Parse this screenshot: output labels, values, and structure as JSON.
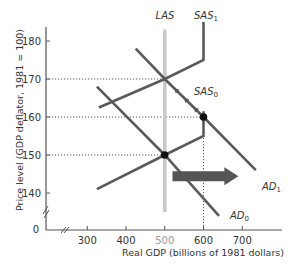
{
  "chart_data": {
    "type": "line",
    "title": "",
    "xlabel": "Real GDP (billions of 1981 dollars)",
    "ylabel": "Price level (GDP deflator, 1981 = 100)",
    "xlim": [
      250,
      800
    ],
    "ylim": [
      135,
      185
    ],
    "x_axis_break": true,
    "y_axis_break": true,
    "origin_label": "0",
    "xticks": [
      300,
      400,
      500,
      600,
      700
    ],
    "xtick_labels": [
      "300",
      "400",
      "500",
      "600",
      "700"
    ],
    "yticks": [
      140,
      150,
      160,
      170,
      180
    ],
    "ytick_labels": [
      "140",
      "150",
      "160",
      "170",
      "180"
    ],
    "grid": false,
    "series": [
      {
        "name": "LAS",
        "label_main": "LAS",
        "label_sub": "",
        "color": "#c8c8c8",
        "points": [
          [
            500,
            135
          ],
          [
            500,
            183
          ]
        ]
      },
      {
        "name": "SAS1",
        "label_main": "SAS",
        "label_sub": "1",
        "color": "#5a5a5a",
        "points": [
          [
            330,
            162.5
          ],
          [
            500,
            170
          ],
          [
            600,
            175
          ],
          [
            600,
            185
          ]
        ]
      },
      {
        "name": "SAS0",
        "label_main": "SAS",
        "label_sub": "0",
        "color": "#5a5a5a",
        "points": [
          [
            325,
            141
          ],
          [
            500,
            150
          ],
          [
            600,
            155
          ],
          [
            600,
            161.5
          ]
        ]
      },
      {
        "name": "AD0",
        "label_main": "AD",
        "label_sub": "0",
        "color": "#5a5a5a",
        "points": [
          [
            325,
            168
          ],
          [
            500,
            150
          ],
          [
            640,
            134
          ]
        ]
      },
      {
        "name": "AD1",
        "label_main": "AD",
        "label_sub": "1",
        "color": "#5a5a5a",
        "points": [
          [
            425,
            178
          ],
          [
            500,
            170
          ],
          [
            600,
            160
          ],
          [
            735,
            146
          ]
        ]
      }
    ],
    "equilibrium_points": [
      {
        "x": 500,
        "y": 150,
        "label": "initial equilibrium"
      },
      {
        "x": 600,
        "y": 160,
        "label": "short-run equilibrium after AD shift"
      },
      {
        "x": 500,
        "y": 170,
        "label": "long-run equilibrium"
      }
    ],
    "reference_lines": [
      {
        "type": "horizontal",
        "y": 170,
        "to_x": 500
      },
      {
        "type": "horizontal",
        "y": 160,
        "to_x": 600
      },
      {
        "type": "horizontal",
        "y": 150,
        "to_x": 500
      },
      {
        "type": "vertical",
        "x": 600,
        "from_y": 160
      }
    ],
    "annotations": [
      {
        "type": "shift-arrow",
        "from": [
          520,
          146
        ],
        "to": [
          690,
          146
        ],
        "meaning": "AD shifts right from AD0 to AD1"
      },
      {
        "type": "path-arrows",
        "along": "AD1",
        "from": [
          600,
          160
        ],
        "to": [
          500,
          170
        ],
        "count": 3,
        "meaning": "economy moves up along AD1 as SAS shifts to SAS1"
      }
    ]
  }
}
